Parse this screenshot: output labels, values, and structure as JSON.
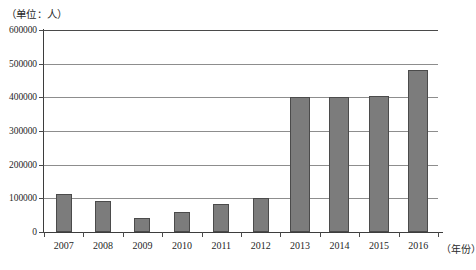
{
  "chart_data": {
    "type": "bar",
    "title": "",
    "subtitle": "",
    "unit_caption": "（单位：人）",
    "xlabel": "（年份）",
    "ylabel": "",
    "categories": [
      "2007",
      "2008",
      "2009",
      "2010",
      "2011",
      "2012",
      "2013",
      "2014",
      "2015",
      "2016"
    ],
    "values": [
      112000,
      92000,
      42000,
      58000,
      82000,
      101000,
      400000,
      400000,
      405000,
      480000
    ],
    "series": [
      {
        "name": "人数",
        "values": [
          112000,
          92000,
          42000,
          58000,
          82000,
          101000,
          400000,
          400000,
          405000,
          480000
        ]
      }
    ],
    "ylim": [
      0,
      600000
    ],
    "xlim_labels": [
      "2007",
      "2016"
    ],
    "ytick_values": [
      0,
      100000,
      200000,
      300000,
      400000,
      500000,
      600000
    ],
    "ytick_labels": [
      "0",
      "100000",
      "200000",
      "300000",
      "400000",
      "500000",
      "600000"
    ],
    "grid": "horizontal",
    "legend": "none",
    "bar_color": "#7c7c7c",
    "bar_edge_color": "#4b4b4b",
    "axis_color": "#3d3d3d",
    "gridline_color": "#8d8d8d",
    "background_color": "#ffffff",
    "annotations": []
  }
}
